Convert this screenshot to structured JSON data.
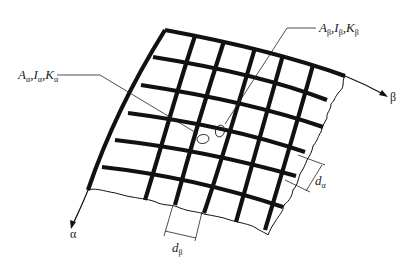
{
  "figure": {
    "beam_counts": {
      "alpha_direction_rows": 6,
      "beta_direction_columns": 6
    }
  },
  "labels": {
    "alpha_beam_props": {
      "A": "A",
      "I": "I",
      "K": "K",
      "sub": "α",
      "sep": ","
    },
    "beta_beam_props": {
      "A": "A",
      "I": "I",
      "K": "K",
      "sub": "β",
      "sep": ","
    },
    "axis_alpha": "α",
    "axis_beta": "β",
    "spacing_alpha": {
      "d": "d",
      "sub": "α"
    },
    "spacing_beta": {
      "d": "d",
      "sub": "β"
    }
  },
  "colors": {
    "ink": "#111111",
    "background": "#ffffff"
  }
}
